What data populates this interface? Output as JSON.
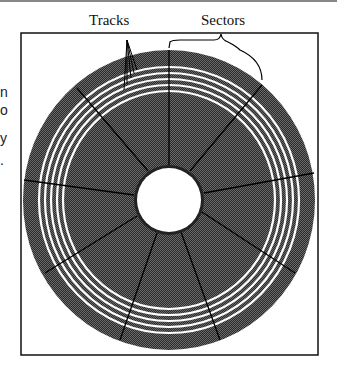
{
  "diagram": {
    "type": "disk-layout",
    "labels": {
      "tracks": "Tracks",
      "sectors": "Sectors"
    },
    "left_text_fragments": [
      "n",
      "o",
      "y",
      "."
    ],
    "sector_count": 10,
    "track_count": 5,
    "colors": {
      "platter": "#3a3a3a",
      "track": "#ffffff",
      "hole": "#ffffff",
      "line": "#000000",
      "frame": "#111111"
    }
  }
}
